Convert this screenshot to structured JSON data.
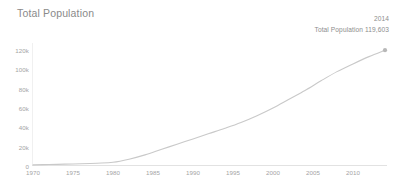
{
  "header": {
    "title": "Total Population"
  },
  "annotation": {
    "year": "2014",
    "value_label": "Total Population 119,603"
  },
  "chart_data": {
    "type": "line",
    "title": "Total Population",
    "xlabel": "",
    "ylabel": "",
    "grid": false,
    "legend": "none",
    "xlim": [
      1970,
      2014
    ],
    "ylim": [
      0,
      125000
    ],
    "xticks": [
      "1970",
      "1975",
      "1980",
      "1985",
      "1990",
      "1995",
      "2000",
      "2005",
      "2010"
    ],
    "xtick_values": [
      1970,
      1975,
      1980,
      1985,
      1990,
      1995,
      2000,
      2005,
      2010
    ],
    "yticks": [
      "0",
      "20k",
      "40k",
      "60k",
      "80k",
      "100k",
      "120k"
    ],
    "ytick_values": [
      0,
      20000,
      40000,
      60000,
      80000,
      100000,
      120000
    ],
    "series": [
      {
        "name": "Total Population",
        "color": "#c9c9c9",
        "x": [
          1970,
          1972,
          1974,
          1976,
          1978,
          1980,
          1982,
          1984,
          1986,
          1988,
          1990,
          1992,
          1994,
          1996,
          1998,
          2000,
          2002,
          2004,
          2006,
          2008,
          2010,
          2012,
          2014
        ],
        "values": [
          1200,
          1500,
          1900,
          2300,
          2900,
          3800,
          7000,
          11500,
          17000,
          22500,
          28000,
          33500,
          39000,
          45000,
          52000,
          60000,
          69000,
          78000,
          88000,
          97500,
          105500,
          113000,
          119603
        ]
      }
    ],
    "endpoint_marker": {
      "x": 2014,
      "y": 119603,
      "label": "119,603"
    }
  }
}
